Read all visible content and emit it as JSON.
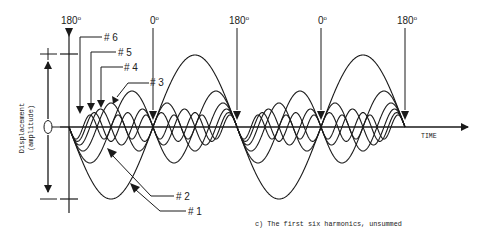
{
  "diagram": {
    "caption": "c) The first six harmonics, unsummed",
    "axis": {
      "x_label": "TIME",
      "y_label_line1": "Displacement",
      "y_label_line2": "(amplitude)",
      "origin_marker": "0"
    },
    "phase_markers": [
      {
        "label": "180",
        "deg": "o",
        "x": 69
      },
      {
        "label": "0",
        "deg": "o",
        "x": 153
      },
      {
        "label": "180",
        "deg": "o",
        "x": 237
      },
      {
        "label": "0",
        "deg": "o",
        "x": 321
      },
      {
        "label": "180",
        "deg": "o",
        "x": 405
      }
    ],
    "harmonics": [
      {
        "label": "# 1",
        "n": 1,
        "amplitude": 72
      },
      {
        "label": "# 2",
        "n": 2,
        "amplitude": 36
      },
      {
        "label": "# 3",
        "n": 3,
        "amplitude": 24
      },
      {
        "label": "# 4",
        "n": 4,
        "amplitude": 18
      },
      {
        "label": "# 5",
        "n": 5,
        "amplitude": 14.4
      },
      {
        "label": "# 6",
        "n": 6,
        "amplitude": 12
      }
    ],
    "geometry": {
      "x_start": 69,
      "x_end": 405,
      "baseline_y": 127,
      "fundamental_period_px": 168
    },
    "colors": {
      "ink": "#1a1a1a",
      "background": "#ffffff"
    }
  }
}
